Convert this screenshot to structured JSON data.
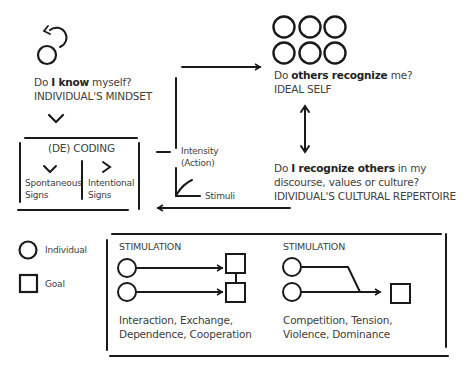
{
  "self": {
    "question_prefix": "Do ",
    "question_bold": "I know",
    "question_suffix": " myself?",
    "label": "INDIVIDUAL'S MINDSET"
  },
  "coding": {
    "title": "(DE) CODING",
    "left_label_1": "Spontaneous",
    "left_label_2": "Signs",
    "right_label_1": "Intentional",
    "right_label_2": "Signs"
  },
  "chart_mini": {
    "y_label_1": "Intensity",
    "y_label_2": "(Action)",
    "x_label": "Stimuli"
  },
  "others": {
    "question_prefix": "Do ",
    "question_bold": "others recognize",
    "question_suffix": " me?",
    "label": "IDEAL SELF"
  },
  "recognize": {
    "question_prefix": "Do ",
    "question_bold": "I recognize others",
    "question_suffix": " in my",
    "line2": "discourse, values or culture?",
    "label": "IDIVIDUAL'S CULTURAL REPERTOIRE"
  },
  "legend": {
    "individual": "Individual",
    "goal": "Goal"
  },
  "stimulation_left": {
    "title": "STIMULATION",
    "desc_1": "Interaction, Exchange,",
    "desc_2": "Dependence, Cooperation"
  },
  "stimulation_right": {
    "title": "STIMULATION",
    "desc_1": "Competition, Tension,",
    "desc_2": "Violence, Dominance"
  },
  "colors": {
    "stroke": "#1a1a1a",
    "text": "#404040"
  }
}
